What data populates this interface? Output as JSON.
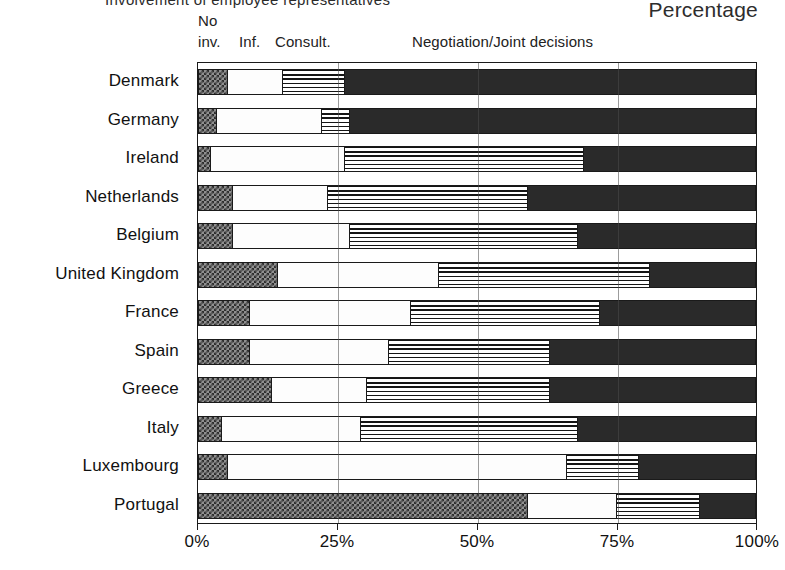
{
  "header": {
    "cut_title": "Involvement of employee representatives",
    "percentage_label": "Percentage"
  },
  "legend": {
    "no": "No",
    "inv": "inv.",
    "inf": "Inf.",
    "consult": "Consult.",
    "negotiation": "Negotiation/Joint decisions"
  },
  "chart_data": {
    "type": "bar",
    "orientation": "horizontal",
    "stacked": true,
    "title": "Involvement of employee representatives",
    "xlabel": "Percentage",
    "ylabel": "",
    "xlim": [
      0,
      100
    ],
    "xticks": [
      0,
      25,
      50,
      75,
      100
    ],
    "xtick_labels": [
      "0%",
      "25%",
      "50%",
      "75%",
      "100%"
    ],
    "grid": true,
    "legend_position": "top",
    "categories": [
      "Denmark",
      "Germany",
      "Ireland",
      "Netherlands",
      "Belgium",
      "United Kingdom",
      "France",
      "Spain",
      "Greece",
      "Italy",
      "Luxembourg",
      "Portugal"
    ],
    "series": [
      {
        "name": "No inv.",
        "pattern": "checkered",
        "color": "#8f8f8f",
        "values": [
          5,
          3,
          2,
          6,
          6,
          14,
          9,
          9,
          13,
          4,
          5,
          59
        ]
      },
      {
        "name": "Inf.",
        "pattern": "solid-white",
        "color": "#fdfdfd",
        "values": [
          10,
          19,
          24,
          17,
          21,
          29,
          29,
          25,
          17,
          25,
          61,
          16
        ]
      },
      {
        "name": "Consult.",
        "pattern": "horizontal-lines",
        "color": "#ffffff",
        "values": [
          11,
          5,
          43,
          36,
          41,
          38,
          34,
          29,
          33,
          39,
          13,
          15
        ]
      },
      {
        "name": "Negotiation/Joint decisions",
        "pattern": "solid-dark",
        "color": "#2a2a2a",
        "values": [
          74,
          73,
          31,
          41,
          32,
          19,
          28,
          37,
          37,
          32,
          21,
          10
        ]
      }
    ]
  }
}
